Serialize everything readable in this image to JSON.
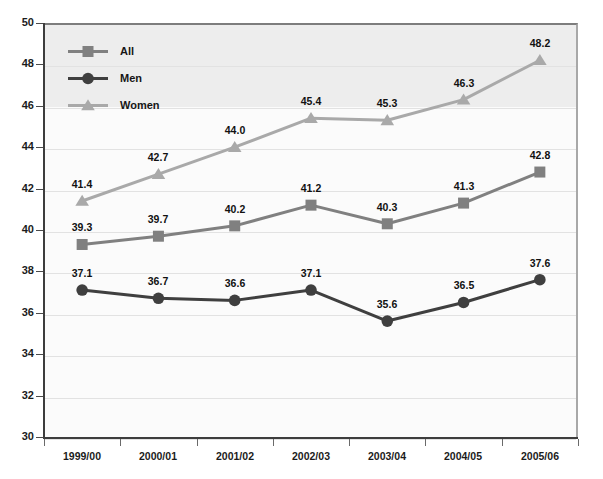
{
  "chart_data": {
    "type": "line",
    "title": "",
    "xlabel": "",
    "ylabel": "",
    "ylim": [
      30,
      50
    ],
    "ytick_step": 2,
    "yticks": [
      "50",
      "48",
      "46",
      "44",
      "42",
      "40",
      "38",
      "36",
      "34",
      "32",
      "30"
    ],
    "grid": true,
    "legend_position": "top-left",
    "categories": [
      "1999/00",
      "2000/01",
      "2001/02",
      "2002/03",
      "2003/04",
      "2004/05",
      "2005/06"
    ],
    "series": [
      {
        "name": "All",
        "marker": "square",
        "color": "#808080",
        "values": [
          39.3,
          39.7,
          40.2,
          41.2,
          40.3,
          41.3,
          42.8
        ],
        "labels": [
          "39.3",
          "39.7",
          "40.2",
          "41.2",
          "40.3",
          "41.3",
          "42.8"
        ]
      },
      {
        "name": "Men",
        "marker": "circle",
        "color": "#3f3f3f",
        "values": [
          37.1,
          36.7,
          36.6,
          37.1,
          35.6,
          36.5,
          37.6
        ],
        "labels": [
          "37.1",
          "36.7",
          "36.6",
          "37.1",
          "35.6",
          "36.5",
          "37.6"
        ]
      },
      {
        "name": "Women",
        "marker": "triangle",
        "color": "#a9a9a9",
        "values": [
          41.4,
          42.7,
          44.0,
          45.4,
          45.3,
          46.3,
          48.2
        ],
        "labels": [
          "41.4",
          "42.7",
          "44.0",
          "45.4",
          "45.3",
          "46.3",
          "48.2"
        ]
      }
    ]
  },
  "legend": {
    "items": [
      {
        "label": "All",
        "marker": "square-marker-icon",
        "color": "#808080"
      },
      {
        "label": "Men",
        "marker": "circle-marker-icon",
        "color": "#3f3f3f"
      },
      {
        "label": "Women",
        "marker": "triangle-marker-icon",
        "color": "#a9a9a9"
      }
    ]
  },
  "colors": {
    "all": "#808080",
    "men": "#3f3f3f",
    "women": "#a9a9a9",
    "plot_background": "#fbfbfb",
    "legend_band": "#ededed",
    "gridline": "#e2e2e2",
    "axis": "#3d3d3d",
    "label_text": "#111111"
  }
}
